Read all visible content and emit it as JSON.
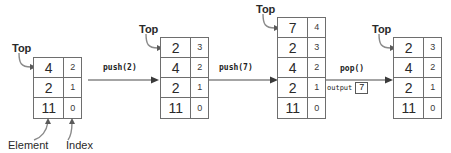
{
  "diagram": {
    "top_pointer_label": "Top",
    "element_callout": "Element",
    "index_callout": "Index",
    "column_headers": {
      "element": "Element",
      "index": "Index"
    },
    "stacks": [
      {
        "name": "initial-stack",
        "rows": [
          {
            "element": "4",
            "index": "2"
          },
          {
            "element": "2",
            "index": "1"
          },
          {
            "element": "11",
            "index": "0"
          }
        ]
      },
      {
        "name": "after-push-2-stack",
        "rows": [
          {
            "element": "2",
            "index": "3"
          },
          {
            "element": "4",
            "index": "2"
          },
          {
            "element": "2",
            "index": "1"
          },
          {
            "element": "11",
            "index": "0"
          }
        ]
      },
      {
        "name": "after-push-7-stack",
        "rows": [
          {
            "element": "7",
            "index": "4"
          },
          {
            "element": "2",
            "index": "3"
          },
          {
            "element": "4",
            "index": "2"
          },
          {
            "element": "2",
            "index": "1"
          },
          {
            "element": "11",
            "index": "0"
          }
        ]
      },
      {
        "name": "after-pop-stack",
        "rows": [
          {
            "element": "2",
            "index": "3"
          },
          {
            "element": "4",
            "index": "2"
          },
          {
            "element": "2",
            "index": "1"
          },
          {
            "element": "11",
            "index": "0"
          }
        ]
      }
    ],
    "operations": [
      {
        "name": "push-2",
        "label": "push(2)",
        "sublabel": "",
        "output": ""
      },
      {
        "name": "push-7",
        "label": "push(7)",
        "sublabel": "",
        "output": ""
      },
      {
        "name": "pop",
        "label": "pop()",
        "sublabel": "output",
        "output": "7"
      }
    ],
    "colors": {
      "line": "#6e6e6e",
      "text": "#2a2a2a",
      "background": "#ffffff"
    }
  }
}
